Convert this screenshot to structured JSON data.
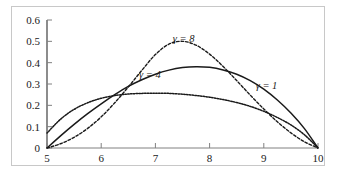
{
  "chart_data": {
    "type": "line",
    "title": "",
    "xlabel": "",
    "ylabel": "",
    "xlim": [
      5,
      10
    ],
    "ylim": [
      0,
      0.6
    ],
    "grid": false,
    "legend_position": "inline-annotations",
    "x_ticks": [
      "5",
      "6",
      "7",
      "8",
      "9",
      "10"
    ],
    "x_tick_values": [
      5,
      6,
      7,
      8,
      9,
      10
    ],
    "y_ticks": [
      "0",
      "0.1",
      "0.2",
      "0.3",
      "0.4",
      "0.5",
      "0.6"
    ],
    "y_tick_values": [
      0,
      0.1,
      0.2,
      0.3,
      0.4,
      0.5,
      0.6
    ],
    "x": [
      5.0,
      5.25,
      5.5,
      5.75,
      6.0,
      6.25,
      6.5,
      6.75,
      7.0,
      7.25,
      7.5,
      7.75,
      8.0,
      8.25,
      8.5,
      8.75,
      9.0,
      9.25,
      9.5,
      9.75,
      10.0
    ],
    "series": [
      {
        "name": "gamma = 1",
        "label": "γ = 1",
        "style": "dotted",
        "color": "#1a1a1a",
        "values": [
          0.07,
          0.135,
          0.181,
          0.212,
          0.233,
          0.246,
          0.253,
          0.256,
          0.257,
          0.256,
          0.252,
          0.246,
          0.238,
          0.227,
          0.213,
          0.195,
          0.172,
          0.143,
          0.108,
          0.062,
          0.0
        ],
        "label_x": 9.05,
        "label_y": 0.276
      },
      {
        "name": "gamma = 4",
        "label": "γ = 4",
        "style": "solid",
        "color": "#1a1a1a",
        "values": [
          0.0,
          0.057,
          0.111,
          0.161,
          0.207,
          0.25,
          0.289,
          0.32,
          0.346,
          0.365,
          0.377,
          0.381,
          0.378,
          0.366,
          0.346,
          0.316,
          0.276,
          0.225,
          0.164,
          0.091,
          0.0
        ],
        "label_x": 6.9,
        "label_y": 0.327
      },
      {
        "name": "gamma = 8",
        "label": "γ = 8",
        "style": "dashed",
        "color": "#1a1a1a",
        "values": [
          0.0,
          0.02,
          0.05,
          0.092,
          0.146,
          0.212,
          0.286,
          0.364,
          0.438,
          0.487,
          0.5,
          0.482,
          0.44,
          0.382,
          0.316,
          0.248,
          0.183,
          0.123,
          0.071,
          0.029,
          0.0
        ],
        "label_x": 7.52,
        "label_y": 0.497
      }
    ]
  },
  "axes": {
    "y_axis_name": "y-axis",
    "x_axis_name": "x-axis"
  },
  "frame": {
    "border_color": "#c8c8c8",
    "background_color": "#ffffff"
  }
}
